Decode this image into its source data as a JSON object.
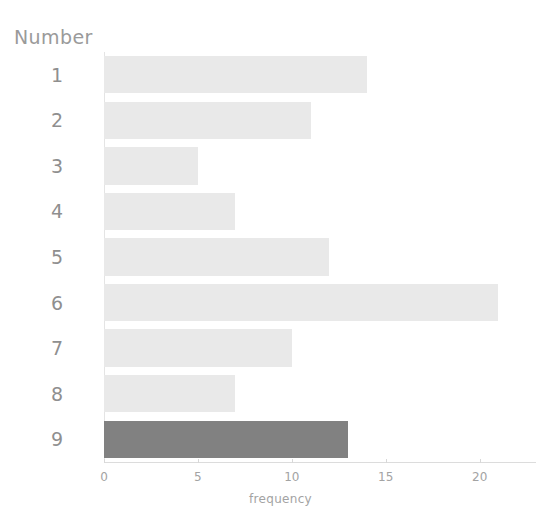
{
  "chart_data": {
    "type": "bar",
    "orientation": "horizontal",
    "title": "",
    "xlabel": "frequency",
    "ylabel": "Number",
    "categories": [
      "1",
      "2",
      "3",
      "4",
      "5",
      "6",
      "7",
      "8",
      "9"
    ],
    "values": [
      14,
      11,
      5,
      7,
      12,
      21,
      10,
      7,
      13
    ],
    "xlim": [
      0,
      23
    ],
    "xticks": [
      0,
      5,
      10,
      15,
      20
    ],
    "xticklabels": [
      "0",
      "5",
      "10",
      "15",
      "20"
    ],
    "grid": false,
    "legend": null,
    "series": [
      {
        "name": "frequency",
        "values": [
          14,
          11,
          5,
          7,
          12,
          21,
          10,
          7,
          13
        ]
      }
    ],
    "highlighted_category": "9",
    "colors": {
      "bar": "#e9e9e9",
      "bar_highlight": "#818181",
      "axis_line": "#dcdcdc",
      "baseline": "#e4e4e4",
      "tick_label": "#a3a3a3",
      "category_label": "#8f8f8f",
      "axis_title": "#9a9a9a",
      "background": "#ffffff"
    }
  }
}
